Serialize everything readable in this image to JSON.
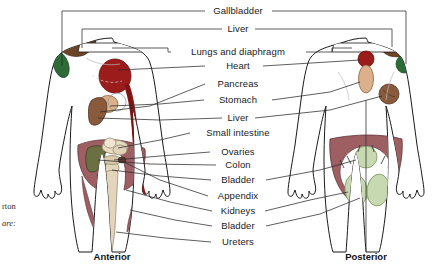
{
  "figure": {
    "title_absent": true,
    "labels": [
      {
        "id": "gallbladder",
        "text": "Gallbladder",
        "x": 238,
        "y": 11
      },
      {
        "id": "liver-top",
        "text": "Liver",
        "x": 238,
        "y": 29
      },
      {
        "id": "lungs-diaphragm",
        "text": "Lungs and diaphragm",
        "x": 238,
        "y": 52
      },
      {
        "id": "heart",
        "text": "Heart",
        "x": 238,
        "y": 66
      },
      {
        "id": "pancreas",
        "text": "Pancreas",
        "x": 238,
        "y": 84
      },
      {
        "id": "stomach",
        "text": "Stomach",
        "x": 238,
        "y": 100
      },
      {
        "id": "liver-mid",
        "text": "Liver",
        "x": 238,
        "y": 118
      },
      {
        "id": "small-intestine",
        "text": "Small intestine",
        "x": 238,
        "y": 133
      },
      {
        "id": "ovaries",
        "text": "Ovaries",
        "x": 238,
        "y": 152
      },
      {
        "id": "colon",
        "text": "Colon",
        "x": 238,
        "y": 165
      },
      {
        "id": "bladder-upper",
        "text": "Bladder",
        "x": 238,
        "y": 180
      },
      {
        "id": "appendix",
        "text": "Appendix",
        "x": 238,
        "y": 196
      },
      {
        "id": "kidneys",
        "text": "Kidneys",
        "x": 238,
        "y": 211
      },
      {
        "id": "bladder-lower",
        "text": "Bladder",
        "x": 238,
        "y": 226
      },
      {
        "id": "ureters",
        "text": "Ureters",
        "x": 238,
        "y": 242
      }
    ],
    "captions": [
      {
        "id": "anterior",
        "text": "Anterior",
        "x": 112,
        "y": 257
      },
      {
        "id": "posterior",
        "text": "Posterior",
        "x": 366,
        "y": 257
      }
    ],
    "margin_notes": [
      {
        "id": "note-rton",
        "text": "rton",
        "x": 2,
        "y": 202,
        "italic": false
      },
      {
        "id": "note-are",
        "text": "are:",
        "x": 2,
        "y": 219,
        "italic": true
      }
    ],
    "colors": {
      "outline": "#1a1a1a",
      "skin": "#ffffff",
      "heart_red": "#9c1b1b",
      "heart_red_dark": "#7e1313",
      "shoulder_green": "#2d6b37",
      "shoulder_brown": "#6d4526",
      "liver_brown": "#8a5a3c",
      "stomach_tan": "#dcb08a",
      "pelvis_mauve": "#9e5f63",
      "colon_olive": "#6b7043",
      "kidney_sage": "#c6d9b0",
      "label_text": "#1b1b1b",
      "leader_line": "#2a2a2a",
      "background": "#ffffff"
    }
  }
}
